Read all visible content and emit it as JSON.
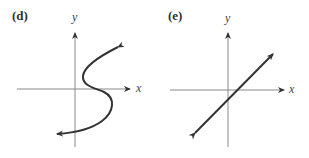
{
  "panels": [
    {
      "id": "d",
      "label": "(d)",
      "x_axis_label": "x",
      "y_axis_label": "y",
      "curve": "S-shaped curve (x as a function of y), arrows at both ends"
    },
    {
      "id": "e",
      "label": "(e)",
      "x_axis_label": "x",
      "y_axis_label": "y",
      "curve": "straight line with positive slope through near the origin, arrows at both ends"
    }
  ],
  "colors": {
    "axis": "#777777",
    "curve": "#333333",
    "text": "#333333"
  }
}
